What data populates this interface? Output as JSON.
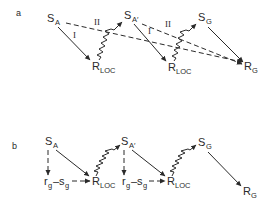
{
  "panels": {
    "a": {
      "letter": "a",
      "nodes": {
        "s_a": {
          "main": "S",
          "sub": "A"
        },
        "s_a_prime": {
          "main": "S",
          "sub": "A′"
        },
        "s_g": {
          "main": "S",
          "sub": "G"
        },
        "r_loc_1": {
          "main": "R",
          "sub": "LOC"
        },
        "r_loc_2": {
          "main": "R",
          "sub": "LOC"
        },
        "r_g": {
          "main": "R",
          "sub": "G"
        }
      },
      "path_labels": {
        "i_1": "I",
        "ii_1": "II",
        "i_2": "I",
        "ii_2": "II"
      }
    },
    "b": {
      "letter": "b",
      "nodes": {
        "s_a": {
          "main": "S",
          "sub": "A"
        },
        "s_a_prime": {
          "main": "S",
          "sub": "A′"
        },
        "s_g": {
          "main": "S",
          "sub": "G"
        },
        "rs_1": {
          "r": "r",
          "r_sub": "g",
          "dash": "–",
          "s": "s",
          "s_sub": "g"
        },
        "r_loc_1": {
          "main": "R",
          "sub": "LOC"
        },
        "rs_2": {
          "r": "r",
          "r_sub": "g",
          "dash": "–",
          "s": "s",
          "s_sub": "g"
        },
        "r_loc_2": {
          "main": "R",
          "sub": "LOC"
        },
        "r_g": {
          "main": "R",
          "sub": "G"
        }
      }
    }
  }
}
